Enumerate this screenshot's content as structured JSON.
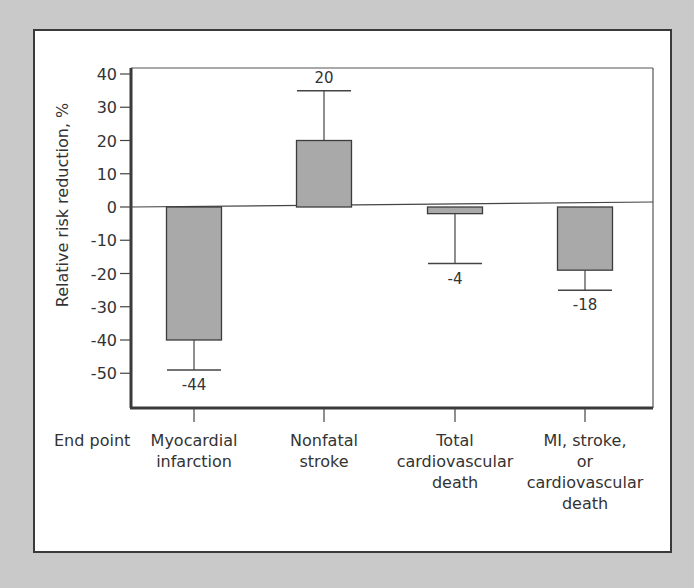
{
  "chart_data": {
    "type": "bar",
    "title": "",
    "xlabel": "End point",
    "ylabel": "Relative risk reduction, %",
    "ylim": [
      -50,
      40
    ],
    "yticks": [
      40,
      30,
      20,
      10,
      0,
      -10,
      -20,
      -30,
      -40,
      -50
    ],
    "grid": false,
    "categories": [
      [
        "Myocardial",
        "infarction"
      ],
      [
        "Nonfatal",
        "stroke"
      ],
      [
        "Total",
        "cardiovascular",
        "death"
      ],
      [
        "MI, stroke,",
        "or",
        "cardiovascular",
        "death"
      ]
    ],
    "values": [
      -40,
      20,
      -2,
      -19
    ],
    "data_labels": [
      "-44",
      "20",
      "-4",
      "-18"
    ],
    "error_bars": [
      {
        "direction": "down",
        "end": -49
      },
      {
        "direction": "up",
        "end": 35
      },
      {
        "direction": "down",
        "end": -17
      },
      {
        "direction": "down",
        "end": -25
      }
    ],
    "colors": {
      "bar_fill": "#a9a9a9",
      "bar_stroke": "#3c3c3c",
      "background": "#c9c9c9"
    }
  }
}
